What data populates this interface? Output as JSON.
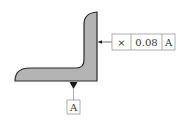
{
  "diagram": {
    "type": "gdt-flatness-annotation",
    "part": {
      "shape": "L-shaped profile",
      "fill_color": "#b4b4b4",
      "stroke_color": "#2a2a2a"
    },
    "feature_control_frame": {
      "symbol": "×",
      "symbol_name": "flatness-symbol",
      "tolerance": "0.08",
      "datum_reference": "A",
      "border_color": "#9a9a9a"
    },
    "datum_feature": {
      "label": "A",
      "triangle_color": "#1a1a1a"
    }
  }
}
